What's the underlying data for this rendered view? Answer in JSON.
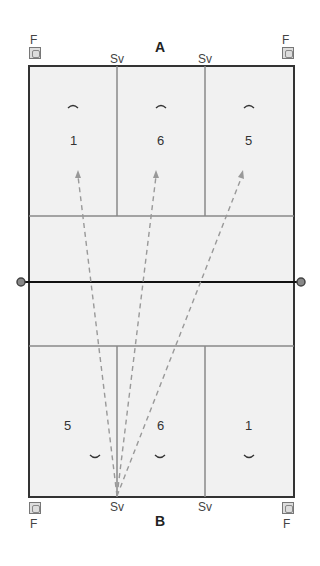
{
  "diagram": {
    "teams": {
      "top": "A",
      "bottom": "B"
    },
    "flag_label": "F",
    "serve_label": "Sv",
    "top_half": {
      "positions": [
        "1",
        "6",
        "5"
      ]
    },
    "bottom_half": {
      "positions": [
        "5",
        "6",
        "1"
      ]
    },
    "colors": {
      "court": "#f1f1f1",
      "lines": "#333333",
      "inner_lines": "#888888",
      "arrows": "#999999",
      "net": "#111111"
    },
    "serve_paths": [
      {
        "from": "Sv (bottom left)",
        "to": "position 1 (team A)"
      },
      {
        "from": "Sv (bottom left)",
        "to": "position 6 (team A)"
      },
      {
        "from": "Sv (bottom left)",
        "to": "position 5 (team A)"
      }
    ]
  }
}
